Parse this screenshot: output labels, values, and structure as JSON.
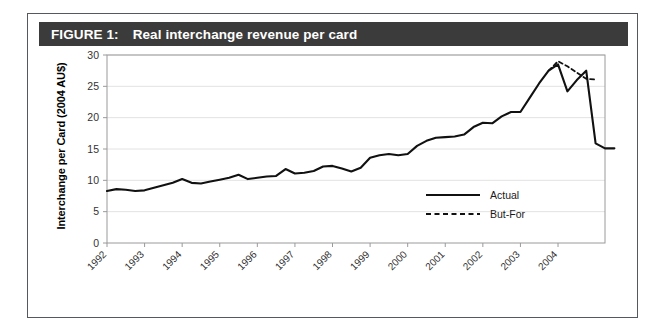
{
  "figure": {
    "label": "FIGURE 1:",
    "title": "Real interchange revenue per card"
  },
  "chart_data": {
    "type": "line",
    "title": "Real interchange revenue per card",
    "xlabel": "",
    "ylabel": "Interchange per Card (2004 AU$)",
    "ylim": [
      0,
      30
    ],
    "yticks": [
      0,
      5,
      10,
      15,
      20,
      25,
      30
    ],
    "xticks": [
      "1992",
      "1993",
      "1994",
      "1995",
      "1996",
      "1997",
      "1998",
      "1999",
      "2000",
      "2001",
      "2002",
      "2003",
      "2004"
    ],
    "xlim": [
      "1992",
      "2005"
    ],
    "grid": "horizontal",
    "legend_position": "lower right",
    "series": [
      {
        "name": "Actual",
        "style": "solid",
        "color": "#111111",
        "x": [
          1992.0,
          1992.25,
          1992.5,
          1992.75,
          1993.0,
          1993.25,
          1993.5,
          1993.75,
          1994.0,
          1994.25,
          1994.5,
          1994.75,
          1995.0,
          1995.25,
          1995.5,
          1995.75,
          1996.0,
          1996.25,
          1996.5,
          1996.75,
          1997.0,
          1997.25,
          1997.5,
          1997.75,
          1998.0,
          1998.25,
          1998.5,
          1998.75,
          1999.0,
          1999.25,
          1999.5,
          1999.75,
          2000.0,
          2000.25,
          2000.5,
          2000.75,
          2001.0,
          2001.25,
          2001.5,
          2001.75,
          2002.0,
          2002.25,
          2002.5,
          2002.75,
          2003.0,
          2003.25,
          2003.5,
          2003.75,
          2004.0,
          2004.25,
          2004.5,
          2004.75
        ],
        "values": [
          8.3,
          8.6,
          8.5,
          8.3,
          8.4,
          8.8,
          9.2,
          9.6,
          10.2,
          9.6,
          9.5,
          9.8,
          10.1,
          10.4,
          10.9,
          10.2,
          10.4,
          10.6,
          10.7,
          11.8,
          11.1,
          11.2,
          11.5,
          12.2,
          12.3,
          11.9,
          11.4,
          12.0,
          13.6,
          14.0,
          14.2,
          14.0,
          14.2,
          15.5,
          16.3,
          16.8,
          16.9,
          17.0,
          17.3,
          18.5,
          19.2,
          19.1,
          20.2,
          20.9,
          20.9,
          23.2,
          25.5,
          27.5,
          28.5,
          24.2,
          26.0,
          27.5
        ],
        "end_values": [
          15.9,
          15.1,
          15.1
        ]
      },
      {
        "name": "But-For",
        "style": "dashed",
        "color": "#111111",
        "x": [
          2003.75,
          2004.0,
          2004.25,
          2004.5,
          2004.75,
          2005.0
        ],
        "values": [
          27.5,
          29.0,
          28.2,
          27.2,
          26.2,
          26.1
        ]
      }
    ],
    "annotations": {
      "note": "Actual series drops sharply after the 2003 peak to about 15, while the dashed But-For counterfactual continues near 26-29."
    }
  },
  "legend": {
    "items": [
      {
        "label": "Actual",
        "style": "solid"
      },
      {
        "label": "But-For",
        "style": "dashed"
      }
    ]
  },
  "colors": {
    "title_bar_bg": "#3b3b3b",
    "title_text": "#ffffff",
    "frame_border": "#55585c",
    "line": "#111111",
    "grid": "#e2e2e2",
    "axis": "#9a9a9a"
  }
}
